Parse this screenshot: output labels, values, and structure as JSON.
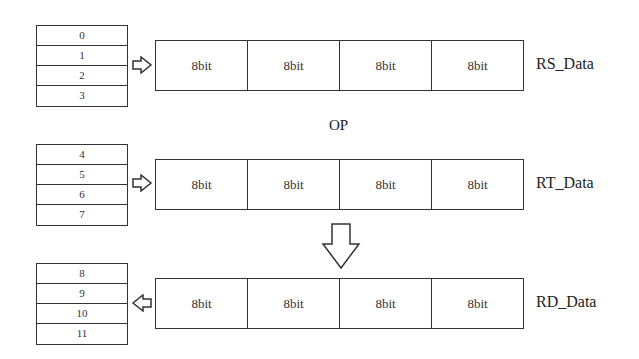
{
  "diagram": {
    "op_label": "OP",
    "rows": [
      {
        "name": "RS_Data",
        "registers": [
          "0",
          "1",
          "2",
          "3"
        ],
        "cells": [
          "8bit",
          "8bit",
          "8bit",
          "8bit"
        ],
        "arrow_direction": "right"
      },
      {
        "name": "RT_Data",
        "registers": [
          "4",
          "5",
          "6",
          "7"
        ],
        "cells": [
          "8bit",
          "8bit",
          "8bit",
          "8bit"
        ],
        "arrow_direction": "right"
      },
      {
        "name": "RD_Data",
        "registers": [
          "8",
          "9",
          "10",
          "11"
        ],
        "cells": [
          "8bit",
          "8bit",
          "8bit",
          "8bit"
        ],
        "arrow_direction": "left"
      }
    ],
    "result_arrow": "down"
  }
}
